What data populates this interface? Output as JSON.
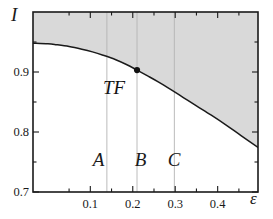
{
  "chart_data": {
    "type": "line",
    "title": "",
    "xlabel": "ε",
    "ylabel": "I",
    "xlim": [
      -0.035,
      0.495
    ],
    "ylim": [
      0.7,
      1.0
    ],
    "grid": false,
    "legend": null,
    "x_ticks_major": [
      0.1,
      0.2,
      0.3,
      0.4
    ],
    "x_tick_labels": [
      "0.1",
      "0.2",
      "0.3",
      "0.4"
    ],
    "x_ticks_minor": [
      0.05,
      0.15,
      0.25,
      0.35,
      0.45
    ],
    "y_ticks_major": [
      0.7,
      0.8,
      0.9
    ],
    "y_tick_labels": [
      "0.7",
      "0.8",
      "0.9"
    ],
    "y_ticks_minor": [
      0.75,
      0.85,
      0.95
    ],
    "series": [
      {
        "name": "boundary-curve",
        "type": "line",
        "color": "#1a1a1a",
        "x": [
          -0.035,
          0.0,
          0.02,
          0.05,
          0.08,
          0.105,
          0.13,
          0.16,
          0.185,
          0.21,
          0.235,
          0.26,
          0.29,
          0.32,
          0.35,
          0.385,
          0.42,
          0.455,
          0.495
        ],
        "y": [
          0.948,
          0.947,
          0.9455,
          0.9425,
          0.938,
          0.9335,
          0.928,
          0.9205,
          0.9125,
          0.9032,
          0.8935,
          0.8835,
          0.8705,
          0.857,
          0.8435,
          0.828,
          0.8115,
          0.794,
          0.7745
        ]
      }
    ],
    "shaded_region": {
      "name": "upper-region",
      "color": "#d9d9d9",
      "description": "area above boundary curve"
    },
    "markers": [
      {
        "name": "TF",
        "label": "TF",
        "x": 0.21,
        "y": 0.9032,
        "color": "#111111"
      }
    ],
    "vertical_lines": [
      {
        "name": "divider-ab",
        "x": 0.139,
        "color": "#b4b4b4"
      },
      {
        "name": "divider-tf",
        "x": 0.21,
        "color": "#b4b4b4"
      },
      {
        "name": "divider-bc",
        "x": 0.298,
        "color": "#b4b4b4"
      }
    ],
    "region_labels": [
      {
        "name": "A",
        "label": "A",
        "x": 0.122,
        "y": 0.753
      },
      {
        "name": "B",
        "label": "B",
        "x": 0.221,
        "y": 0.753
      },
      {
        "name": "C",
        "label": "C",
        "x": 0.299,
        "y": 0.753
      }
    ]
  }
}
